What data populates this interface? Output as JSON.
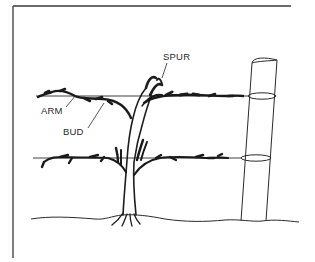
{
  "diagram": {
    "ink_color": "#2a2a2a",
    "background": "#ffffff",
    "labels": [
      {
        "id": "spur",
        "text": "SPUR",
        "x": 163,
        "y": 60
      },
      {
        "id": "arm",
        "text": "ARM",
        "x": 41,
        "y": 114
      },
      {
        "id": "bud",
        "text": "BUD",
        "x": 63,
        "y": 135
      }
    ],
    "parts": {
      "frame": "corner-border-top-left",
      "trellis_wires": 2,
      "post": "wooden-post-right",
      "ground": "wavy-ground-line",
      "trunk": "central-trunk-with-roots"
    }
  }
}
